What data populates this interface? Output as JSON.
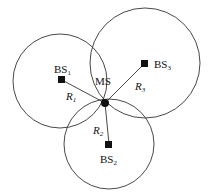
{
  "diagram": {
    "mobile_station": {
      "label": "MS",
      "x": 105,
      "y": 103
    },
    "base_stations": [
      {
        "id": "BS1",
        "label": "BS",
        "sub": "1",
        "x": 62,
        "y": 80,
        "radius_label": "R",
        "radius_sub": "1",
        "circle": {
          "cx": 60,
          "cy": 81,
          "r": 47
        }
      },
      {
        "id": "BS2",
        "label": "BS",
        "sub": "2",
        "x": 109,
        "y": 144,
        "radius_label": "R",
        "radius_sub": "2",
        "circle": {
          "cx": 109,
          "cy": 144,
          "r": 45
        }
      },
      {
        "id": "BS3",
        "label": "BS",
        "sub": "3",
        "x": 145,
        "y": 63,
        "radius_label": "R",
        "radius_sub": "3",
        "circle": {
          "cx": 145,
          "cy": 63,
          "r": 54
        }
      }
    ],
    "colors": {
      "stroke": "#333333",
      "fill": "#111111"
    }
  }
}
